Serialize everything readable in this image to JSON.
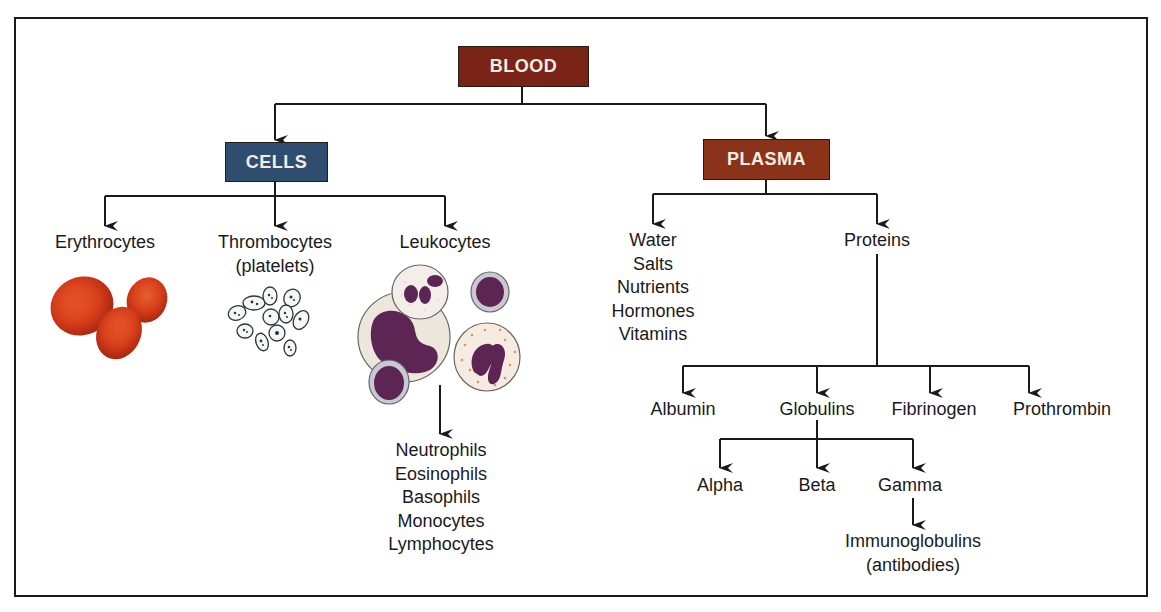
{
  "diagram": {
    "root": {
      "label": "BLOOD",
      "color": "#7a2418"
    },
    "cells": {
      "label": "CELLS",
      "color": "#2f4d6e",
      "children": [
        {
          "label": "Erythrocytes",
          "illustration": "red-blood-cells"
        },
        {
          "label": "Thrombocytes",
          "sublabel": "(platelets)",
          "illustration": "platelets"
        },
        {
          "label": "Leukocytes",
          "illustration": "white-blood-cells",
          "types": [
            "Neutrophils",
            "Eosinophils",
            "Basophils",
            "Monocytes",
            "Lymphocytes"
          ]
        }
      ]
    },
    "plasma": {
      "label": "PLASMA",
      "color": "#8a3318",
      "components": [
        "Water",
        "Salts",
        "Nutrients",
        "Hormones",
        "Vitamins"
      ],
      "proteins": {
        "label": "Proteins",
        "children": [
          {
            "label": "Albumin"
          },
          {
            "label": "Globulins",
            "children": [
              {
                "label": "Alpha"
              },
              {
                "label": "Beta"
              },
              {
                "label": "Gamma",
                "child": {
                  "label": "Immunoglobulins",
                  "sublabel": "(antibodies)"
                }
              }
            ]
          },
          {
            "label": "Fibrinogen"
          },
          {
            "label": "Prothrombin"
          }
        ]
      }
    }
  },
  "colors": {
    "line": "#1a1a1a",
    "rbc": "#d8401e",
    "nucleus": "#5c2553",
    "cytoplasm": "#efe8e0"
  }
}
